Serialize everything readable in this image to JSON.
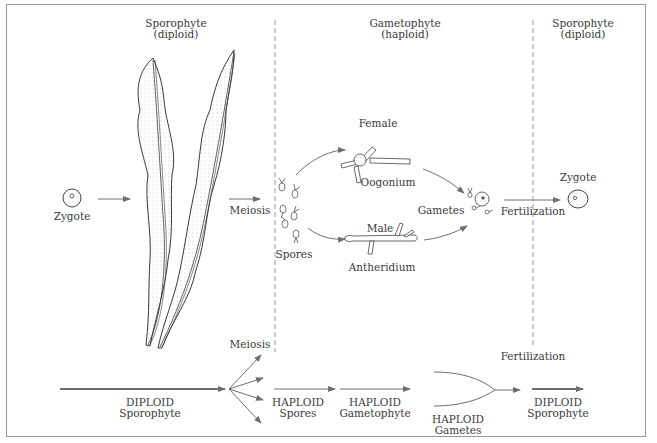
{
  "diagram": {
    "type": "life-cycle",
    "sections": [
      {
        "title": "Sporophyte",
        "subtitle": "(diploid)"
      },
      {
        "title": "Gametophyte",
        "subtitle": "(haploid)"
      },
      {
        "title": "Sporophyte",
        "subtitle": "(diploid)"
      }
    ],
    "top": {
      "zygote_left": "Zygote",
      "meiosis": "Meiosis",
      "spores": "Spores",
      "female": "Female",
      "oogonium": "Oogonium",
      "male": "Male",
      "antheridium": "Antheridium",
      "gametes": "Gametes",
      "fertilization": "Fertilization",
      "zygote_right": "Zygote"
    },
    "bottom": {
      "meiosis": "Meiosis",
      "fertilization": "Fertilization",
      "stages": [
        {
          "ploidy": "DIPLOID",
          "name": "Sporophyte"
        },
        {
          "ploidy": "HAPLOID",
          "name": "Spores"
        },
        {
          "ploidy": "HAPLOID",
          "name": "Gametophyte"
        },
        {
          "ploidy": "HAPLOID",
          "name": "Gametes"
        },
        {
          "ploidy": "DIPLOID",
          "name": "Sporophyte"
        }
      ]
    },
    "colors": {
      "ink": "#3a3a3a",
      "arrow": "#6e6e6e",
      "divider": "#9a9a9a",
      "border": "#9a9a9a"
    }
  }
}
